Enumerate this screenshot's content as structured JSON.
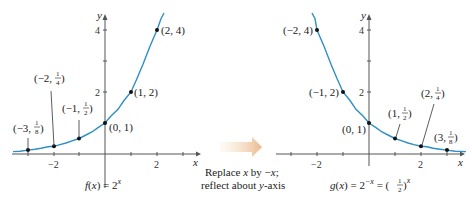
{
  "left_graph": {
    "function_label": "f(x) = 2^x",
    "function_name": "f(x) = 2",
    "exponent": "x",
    "axis_x_label": "x",
    "axis_y_label": "y",
    "x_tick_labels": [
      "−2",
      "2"
    ],
    "y_tick_labels": [
      "2",
      "4"
    ],
    "points": [
      {
        "label": "(−3, 1/8)",
        "x": -3,
        "y": 0.125
      },
      {
        "label": "(−2, 1/4)",
        "x": -2,
        "y": 0.25
      },
      {
        "label": "(−1, 1/2)",
        "x": -1,
        "y": 0.5
      },
      {
        "label": "(0, 1)",
        "x": 0,
        "y": 1
      },
      {
        "label": "(1, 2)",
        "x": 1,
        "y": 2
      },
      {
        "label": "(2, 4)",
        "x": 2,
        "y": 4
      }
    ]
  },
  "transform": {
    "line1_a": "Replace ",
    "line1_x": "x",
    "line1_b": " by −",
    "line1_x2": "x",
    "line1_c": ";",
    "line2_a": "reflect about ",
    "line2_y": "y",
    "line2_b": "-axis"
  },
  "right_graph": {
    "function_label": "g(x) = 2^−x = (1/2)^x",
    "function_name": "g(x) = 2",
    "exponent1": "−x",
    "equals": " = ",
    "exponent2": "x",
    "axis_x_label": "x",
    "axis_y_label": "y",
    "x_tick_labels": [
      "−2",
      "2"
    ],
    "y_tick_labels": [
      "2",
      "4"
    ],
    "points": [
      {
        "label": "(−2, 4)",
        "x": -2,
        "y": 4
      },
      {
        "label": "(−1, 2)",
        "x": -1,
        "y": 2
      },
      {
        "label": "(0, 1)",
        "x": 0,
        "y": 1
      },
      {
        "label": "(1, 1/2)",
        "x": 1,
        "y": 0.5
      },
      {
        "label": "(2, 1/4)",
        "x": 2,
        "y": 0.25
      },
      {
        "label": "(3, 1/8)",
        "x": 3,
        "y": 0.125
      }
    ]
  },
  "colors": {
    "curve": "#2f8fc4",
    "arrow": "#f0c9a0"
  }
}
